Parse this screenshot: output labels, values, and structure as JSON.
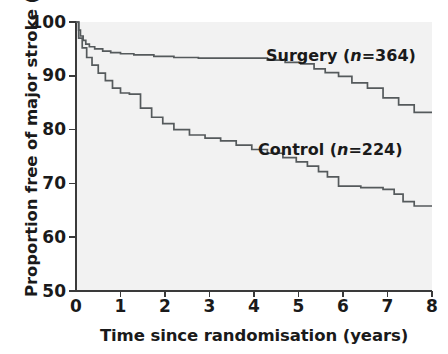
{
  "chart_data": {
    "type": "line",
    "title": "",
    "xlabel": "Time since randomisation (years)",
    "ylabel": "Proportion free of major stroke (%)",
    "xlim": [
      0,
      8
    ],
    "ylim": [
      50,
      100
    ],
    "xticks": [
      0,
      1,
      2,
      3,
      4,
      5,
      6,
      7,
      8
    ],
    "xtick_labels": [
      "0",
      "1",
      "2",
      "3",
      "4",
      "5",
      "6",
      "7",
      "8"
    ],
    "yticks": [
      50,
      60,
      70,
      80,
      90,
      100
    ],
    "ytick_labels": [
      "50",
      "60",
      "70",
      "80",
      "90",
      "100"
    ],
    "grid": false,
    "legend_position": "in-plot-annotations",
    "line_color": "#555a5c",
    "plot_background": "#f2f2f2",
    "series": [
      {
        "name": "Surgery (n=364)",
        "label_plain": "Surgery",
        "n": 364,
        "step": "post",
        "x": [
          0.0,
          0.06,
          0.1,
          0.16,
          0.22,
          0.3,
          0.42,
          0.6,
          0.78,
          1.0,
          1.3,
          1.75,
          2.2,
          2.75,
          3.3,
          3.85,
          4.3,
          4.7,
          5.05,
          5.35,
          5.6,
          5.9,
          6.2,
          6.55,
          6.9,
          7.25,
          7.6,
          8.0
        ],
        "y": [
          100.0,
          98.5,
          97.4,
          96.6,
          95.9,
          95.4,
          95.0,
          94.6,
          94.3,
          94.1,
          93.9,
          93.6,
          93.4,
          93.3,
          93.3,
          93.3,
          92.9,
          92.5,
          92.2,
          91.3,
          90.6,
          89.9,
          88.7,
          87.7,
          85.9,
          84.6,
          83.2,
          83.2
        ]
      },
      {
        "name": "Control (n=224)",
        "label_plain": "Control",
        "n": 224,
        "step": "post",
        "x": [
          0.0,
          0.06,
          0.14,
          0.24,
          0.36,
          0.5,
          0.66,
          0.82,
          1.0,
          1.2,
          1.45,
          1.7,
          1.95,
          2.2,
          2.55,
          2.9,
          3.25,
          3.6,
          3.95,
          4.3,
          4.65,
          4.95,
          5.2,
          5.45,
          5.65,
          5.9,
          6.4,
          6.9,
          7.15,
          7.35,
          7.6,
          8.0
        ],
        "y": [
          100.0,
          97.0,
          95.2,
          93.4,
          92.0,
          90.5,
          89.1,
          87.7,
          86.8,
          86.6,
          84.0,
          82.3,
          81.1,
          80.0,
          79.0,
          78.4,
          77.9,
          77.1,
          76.3,
          75.6,
          74.8,
          74.0,
          73.2,
          72.2,
          71.2,
          69.5,
          69.2,
          68.9,
          68.0,
          66.6,
          65.8,
          65.8
        ]
      }
    ]
  },
  "labels": {
    "surgery_prefix": "Surgery (",
    "surgery_n_italic": "n",
    "surgery_suffix": "=364)",
    "control_prefix": "Control (",
    "control_n_italic": "n",
    "control_suffix": "=224)"
  }
}
